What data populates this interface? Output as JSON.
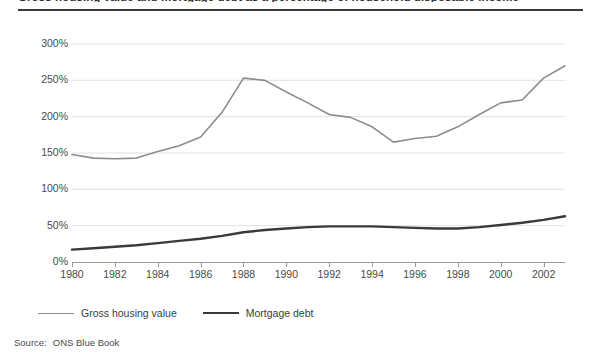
{
  "figure": {
    "title": "Gross housing value and mortgage debt as a percentage of household disposable income",
    "source_label": "Source:",
    "source_value": "ONS Blue Book"
  },
  "legend": {
    "position": "below-axis-left",
    "items": [
      {
        "name": "gross-housing-value",
        "label": "Gross housing value",
        "color": "#8c8c8c"
      },
      {
        "name": "mortgage-debt",
        "label": "Mortgage debt",
        "color": "#3a3a3a"
      }
    ]
  },
  "chart_data": {
    "type": "line",
    "title": "Gross housing value and mortgage debt as a percentage of household disposable income",
    "xlabel": "",
    "ylabel": "",
    "grid": true,
    "legend_position": "bottom-left",
    "xlim": [
      1980,
      2003
    ],
    "ylim": [
      0,
      300
    ],
    "x": [
      1980,
      1981,
      1982,
      1983,
      1984,
      1985,
      1986,
      1987,
      1988,
      1989,
      1990,
      1991,
      1992,
      1993,
      1994,
      1995,
      1996,
      1997,
      1998,
      1999,
      2000,
      2001,
      2002,
      2003
    ],
    "xticks": [
      1980,
      1982,
      1984,
      1986,
      1988,
      1990,
      1992,
      1994,
      1996,
      1998,
      2000,
      2002
    ],
    "xticklabels": [
      "1980",
      "1982",
      "1984",
      "1986",
      "1988",
      "1990",
      "1992",
      "1994",
      "1996",
      "1998",
      "2000",
      "2002"
    ],
    "yticks": [
      0,
      50,
      100,
      150,
      200,
      250,
      300
    ],
    "yticklabels": [
      "0%",
      "50%",
      "100%",
      "150%",
      "200%",
      "250%",
      "300%"
    ],
    "series": [
      {
        "name": "Gross housing value",
        "color": "#8c8c8c",
        "linewidth": 1.6,
        "values": [
          148,
          143,
          142,
          143,
          152,
          160,
          172,
          206,
          253,
          250,
          234,
          219,
          203,
          199,
          186,
          165,
          170,
          173,
          186,
          203,
          219,
          223,
          253,
          270
        ]
      },
      {
        "name": "Mortgage debt",
        "color": "#3a3a3a",
        "linewidth": 2.4,
        "values": [
          17,
          19,
          21,
          23,
          26,
          29,
          32,
          36,
          41,
          44,
          46,
          48,
          49,
          49,
          49,
          48,
          47,
          46,
          46,
          48,
          51,
          54,
          58,
          63
        ]
      }
    ]
  }
}
